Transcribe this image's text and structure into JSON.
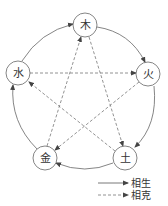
{
  "diagram": {
    "nodes": [
      {
        "id": "wood",
        "label": "木",
        "x": 85,
        "y": 25
      },
      {
        "id": "fire",
        "label": "火",
        "x": 148,
        "y": 74
      },
      {
        "id": "earth",
        "label": "土",
        "x": 125,
        "y": 158
      },
      {
        "id": "metal",
        "label": "金",
        "x": 45,
        "y": 158
      },
      {
        "id": "water",
        "label": "水",
        "x": 18,
        "y": 73
      }
    ],
    "generating_cycle": [
      "木→火",
      "火→土",
      "土→金",
      "金→水",
      "水→木"
    ],
    "overcoming_cycle": [
      "木→土",
      "土→水",
      "水→火",
      "火→金",
      "金→木"
    ],
    "colors": {
      "stroke": "#555555",
      "node_fill": "#ffffff"
    }
  },
  "legend": {
    "solid_label": "相生",
    "dashed_label": "相克"
  }
}
